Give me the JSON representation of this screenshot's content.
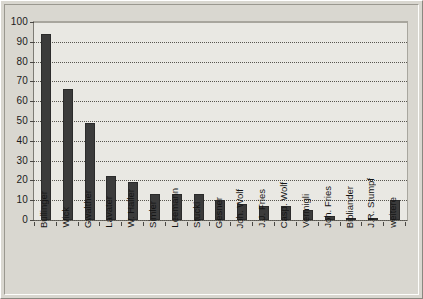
{
  "chart_data": {
    "type": "bar",
    "title": "",
    "subtitle": "",
    "xlabel": "",
    "ylabel": "",
    "ylim": [
      0,
      100
    ],
    "ytick_step": 10,
    "yticks": [
      "0",
      "10",
      "20",
      "30",
      "40",
      "50",
      "60",
      "70",
      "80",
      "90",
      "100"
    ],
    "grid": "horizontal-dotted",
    "legend": "none",
    "bar_color": "#3b3b3b",
    "plot_background": "#e9e8e3",
    "frame_background": "#d9d7d0",
    "categories": [
      "Bullinger",
      "Wick",
      "Gwalther",
      "Lavater",
      "W. Haller",
      "Simler",
      "Leemann",
      "Stucki",
      "Gesner",
      "Joh. Wolf",
      "J.J. Fries",
      "Casp. Wolf",
      "Vermigli",
      "Joh. Fries",
      "Bibliander",
      "J.R. Stumpf",
      "weitere"
    ],
    "values": [
      94,
      66,
      49,
      22,
      19,
      13,
      13,
      13,
      10,
      8,
      7,
      7,
      5,
      2,
      1,
      1,
      10
    ]
  }
}
